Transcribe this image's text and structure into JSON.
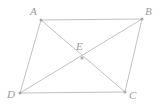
{
  "figure": {
    "type": "geometry-diagram",
    "name": "parallelogram-with-diagonals",
    "background_color": "#ffffff",
    "stroke_color": "#b9b9b9",
    "label_color": "#9a9a9a",
    "marker_color": "#a8a8a8",
    "width": 160,
    "height": 106
  },
  "labels": {
    "a": "A",
    "b": "B",
    "c": "C",
    "d": "D",
    "e": "E"
  },
  "points": {
    "A": {
      "x": 41,
      "y": 20
    },
    "B": {
      "x": 142,
      "y": 19
    },
    "C": {
      "x": 125,
      "y": 92
    },
    "D": {
      "x": 20,
      "y": 93
    },
    "E": {
      "x": 82,
      "y": 58
    }
  },
  "segments": [
    {
      "name": "AB",
      "from": "A",
      "to": "B"
    },
    {
      "name": "BC",
      "from": "B",
      "to": "C"
    },
    {
      "name": "CD",
      "from": "C",
      "to": "D"
    },
    {
      "name": "DA",
      "from": "D",
      "to": "A"
    },
    {
      "name": "AC",
      "from": "A",
      "to": "C"
    },
    {
      "name": "BD",
      "from": "B",
      "to": "D"
    }
  ]
}
